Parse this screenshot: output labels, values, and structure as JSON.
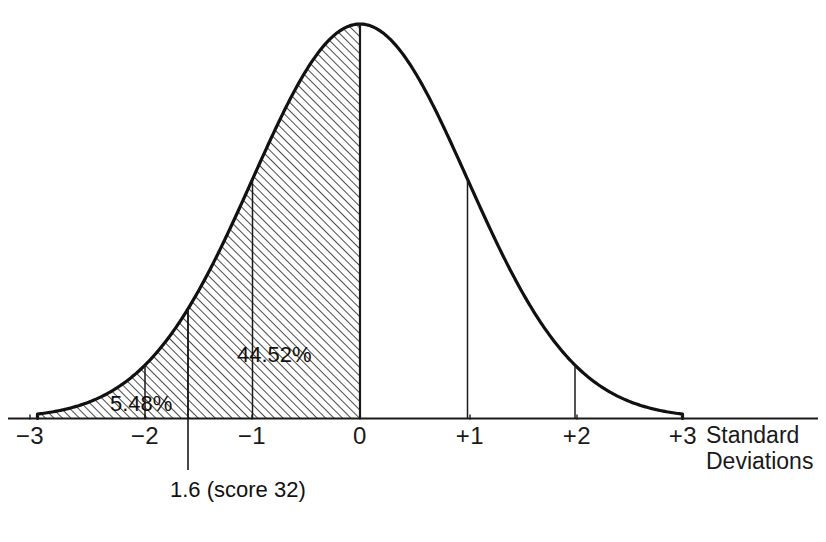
{
  "chart_data": {
    "type": "area",
    "title": "",
    "subtitle": "",
    "xlabel_line1": "Standard",
    "xlabel_line2": "Deviations",
    "ylabel": "",
    "distribution": "standard normal",
    "mean": 0,
    "sd": 1,
    "x": [
      -3,
      -2,
      -1,
      0,
      1,
      2,
      3
    ],
    "tick_labels": [
      "−3",
      "−2",
      "−1",
      "0",
      "+1",
      "+2",
      "+3"
    ],
    "xlim": [
      -3,
      3
    ],
    "ylim": [
      0,
      1
    ],
    "grid": false,
    "legend": "none",
    "ordinate_lines": [
      -2,
      -1.6,
      -1,
      0,
      1,
      2
    ],
    "shaded_region": {
      "from": -3,
      "to": 0,
      "fill": "diagonal-hatch",
      "hatch_angle_deg": 45
    },
    "annotations": [
      {
        "id": "area-main",
        "text": "44.52%",
        "x": -1.0,
        "y_fraction": 0.3,
        "describes": "area between −1.6 SD and 0 SD"
      },
      {
        "id": "area-tail",
        "text": "5.48%",
        "x": -2.3,
        "y_fraction": 0.05,
        "describes": "area below −1.6 SD"
      },
      {
        "id": "score-callout",
        "text": "1.6 (score 32)",
        "x": -1.6,
        "leader_line": true,
        "describes": "cut score marker at −1.6 standard deviations"
      }
    ],
    "colors": {
      "curve": "#111111",
      "axis": "#1a1a1a",
      "hatch": "#2b2b2b",
      "background": "#ffffff",
      "text": "#111111"
    }
  },
  "ticks": [
    {
      "label": "−3",
      "px": 30
    },
    {
      "label": "−2",
      "px": 145
    },
    {
      "label": "−1",
      "px": 252
    },
    {
      "label": "0",
      "px": 360
    },
    {
      "label": "+1",
      "px": 470
    },
    {
      "label": "+2",
      "px": 577
    },
    {
      "label": "+3",
      "px": 683
    }
  ],
  "axis_title": {
    "line1": "Standard",
    "line2": "Deviations"
  },
  "labels": {
    "main_area": "44.52%",
    "tail_area": "5.48%",
    "callout": "1.6 (score 32)"
  }
}
